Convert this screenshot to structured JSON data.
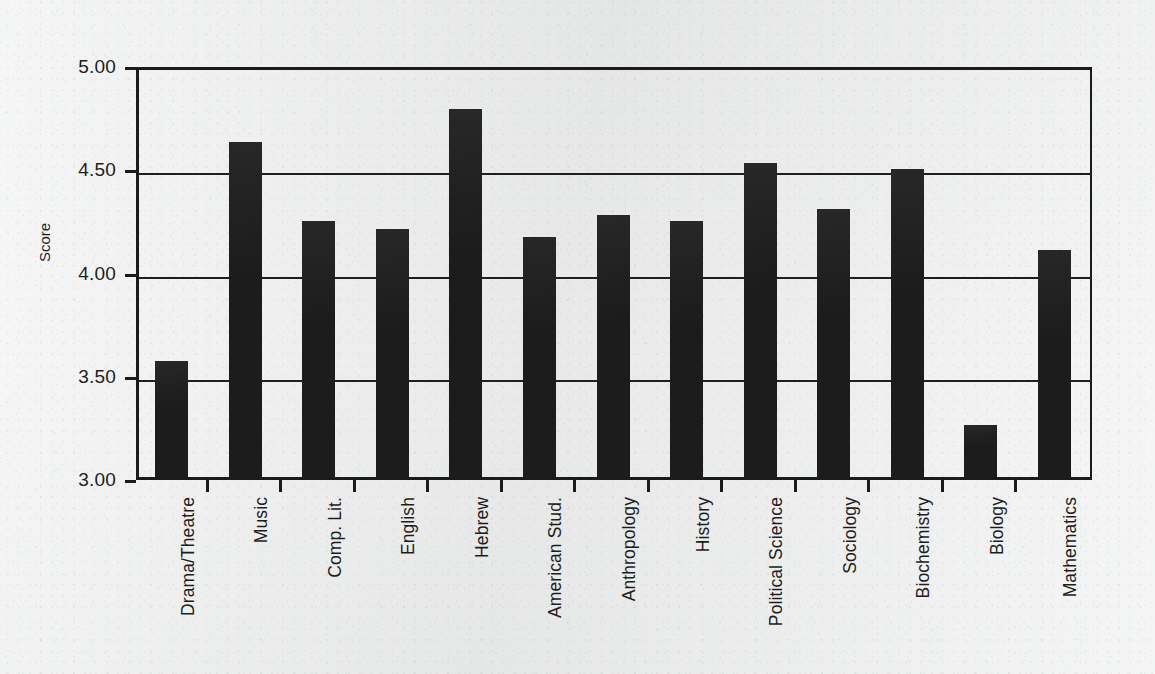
{
  "chart_data": {
    "type": "bar",
    "title": "",
    "xlabel": "",
    "ylabel": "Score",
    "ylim": [
      3.0,
      5.0
    ],
    "ytick_labels": [
      "5.00",
      "4.50",
      "4.00",
      "3.50",
      "3.00"
    ],
    "ytick_values": [
      5.0,
      4.5,
      4.0,
      3.5,
      3.0
    ],
    "grid": true,
    "legend": "none",
    "bar_color": "#1c1c1c",
    "background_color": "#eceded",
    "axis_color": "#1b1b1b",
    "categories": [
      "Drama/Theatre",
      "Music",
      "Comp. Lit.",
      "English",
      "Hebrew",
      "American Stud.",
      "Anthropology",
      "History",
      "Political  Science",
      "Sociology",
      "Biochemistry",
      "Biology",
      "Mathematics"
    ],
    "values": [
      3.56,
      4.62,
      4.24,
      4.2,
      4.78,
      4.16,
      4.27,
      4.24,
      4.52,
      4.3,
      4.49,
      3.25,
      4.1
    ]
  },
  "artifacts": {
    "ghost_text": ""
  }
}
